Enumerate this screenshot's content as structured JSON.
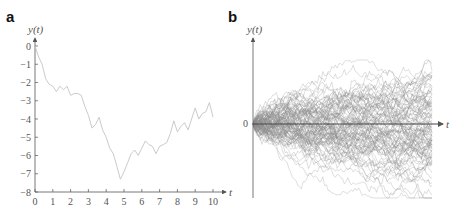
{
  "chart_data": [
    {
      "panel": "a",
      "type": "line",
      "title": "",
      "xlabel": "t",
      "ylabel": "y(t)",
      "xlim": [
        0,
        10
      ],
      "ylim": [
        -8,
        0
      ],
      "xticks": [
        "0",
        "1",
        "2",
        "3",
        "4",
        "5",
        "6",
        "7",
        "8",
        "9",
        "10"
      ],
      "yticks": [
        "0",
        "-1",
        "-2",
        "-3",
        "-4",
        "-5",
        "-6",
        "-7",
        "-8"
      ],
      "grid": false,
      "legend": null,
      "series": [
        {
          "name": "single random walk",
          "x": [
            0,
            0.2,
            0.4,
            0.6,
            0.8,
            1.0,
            1.2,
            1.4,
            1.6,
            1.8,
            2.0,
            2.2,
            2.4,
            2.6,
            2.8,
            3.0,
            3.2,
            3.4,
            3.6,
            3.8,
            4.0,
            4.2,
            4.4,
            4.6,
            4.8,
            5.0,
            5.2,
            5.4,
            5.6,
            5.8,
            6.0,
            6.2,
            6.4,
            6.6,
            6.8,
            7.0,
            7.2,
            7.4,
            7.6,
            7.8,
            8.0,
            8.2,
            8.4,
            8.6,
            8.8,
            9.0,
            9.2,
            9.4,
            9.6,
            9.8,
            10.0
          ],
          "y": [
            0,
            -0.6,
            -1.0,
            -1.8,
            -2.1,
            -2.2,
            -2.5,
            -2.2,
            -2.4,
            -2.2,
            -2.7,
            -2.6,
            -2.6,
            -2.7,
            -3.3,
            -3.8,
            -4.5,
            -4.3,
            -3.9,
            -4.6,
            -5.0,
            -5.6,
            -5.9,
            -6.6,
            -7.3,
            -6.9,
            -6.4,
            -5.9,
            -5.7,
            -6.0,
            -5.6,
            -5.2,
            -5.4,
            -5.5,
            -5.9,
            -5.5,
            -5.4,
            -5.3,
            -4.8,
            -4.1,
            -4.7,
            -4.4,
            -4.2,
            -4.6,
            -4.0,
            -3.4,
            -4.0,
            -3.7,
            -3.6,
            -3.1,
            -3.9
          ]
        }
      ]
    },
    {
      "panel": "b",
      "type": "line",
      "title": "",
      "xlabel": "t",
      "ylabel": "y(t)",
      "yticks": [
        "0"
      ],
      "grid": false,
      "legend": null,
      "description": "~100 overlaid random-walk sample paths starting at 0, spreading out over time (envelope grows like sqrt(t))",
      "n_paths": 100,
      "n_steps": 100
    }
  ],
  "labels": {
    "panel_a": "a",
    "panel_b": "b",
    "ylabel_a": "y(t)",
    "ylabel_b": "y(t)",
    "xlabel_a": "t",
    "xlabel_b": "t",
    "zero_b": "0"
  },
  "colors": {
    "line_a": "#c4c4c4",
    "lines_b": "#8a8a8a",
    "axis": "#555555"
  }
}
